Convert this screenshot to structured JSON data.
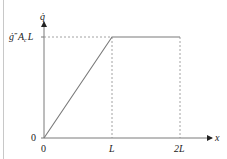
{
  "diagram": {
    "type": "piecewise-linear-plot",
    "y_axis_label": "q̇",
    "x_axis_label": "x",
    "y_tick_labels": {
      "zero": "0",
      "max": {
        "base": "ġ",
        "prime": "‴",
        "a": "A",
        "sub": "c",
        "l": "L"
      }
    },
    "x_tick_labels": [
      "0",
      "L",
      "2L"
    ],
    "curve_points": [
      {
        "x": 0,
        "y": 0
      },
      {
        "x": 1,
        "y": 1
      },
      {
        "x": 2,
        "y": 1
      }
    ],
    "x_range": [
      0,
      2
    ],
    "y_range": [
      0,
      1
    ],
    "colors": {
      "axis": "#7a7a7a",
      "curve": "#7a7a7a",
      "guide": "#8a8a8a",
      "text": "#222222"
    }
  }
}
